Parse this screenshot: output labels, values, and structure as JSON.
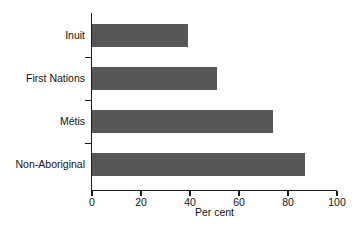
{
  "chart_data": {
    "type": "bar",
    "orientation": "horizontal",
    "title": "",
    "subtitle": "",
    "categories": [
      "Inuit",
      "First Nations",
      "Métis",
      "Non-Aboriginal"
    ],
    "values": [
      39,
      51,
      74,
      87
    ],
    "series": [
      {
        "name": "Per cent",
        "values": [
          39,
          51,
          74,
          87
        ]
      }
    ],
    "xlabel": "Per cent",
    "ylabel": "",
    "xlim": [
      0,
      100
    ],
    "xticks": [
      0,
      20,
      40,
      60,
      80,
      100
    ],
    "xtick_labels": [
      "0",
      "20",
      "40",
      "60",
      "80",
      "100"
    ],
    "grid": false,
    "legend": false,
    "legend_position": "none",
    "bar_color": "#575757",
    "axis_color": "#1a1a1a",
    "background_color": "#ffffff",
    "annotations": []
  }
}
